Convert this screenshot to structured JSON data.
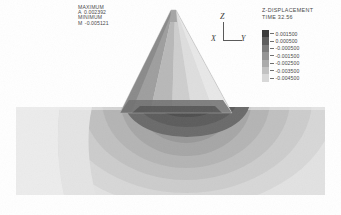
{
  "annotations": {
    "maximum_label": "MAXIMUM",
    "maximum_tag": "A",
    "maximum_value": "0.002392",
    "minimum_label": "MINIMUM",
    "minimum_tag": "M",
    "minimum_value": "-0.005121"
  },
  "triad": {
    "z_label": "Z",
    "y_label": "Y",
    "x_label": "X"
  },
  "legend": {
    "title": "Z-DISPLACEMENT",
    "subtitle": "TIME 32.56",
    "entries": [
      {
        "label": "0.001500",
        "color": "#3c3c3c"
      },
      {
        "label": "0.000500",
        "color": "#5e5e5e"
      },
      {
        "label": "-0.000500",
        "color": "#7b7b7b"
      },
      {
        "label": "-0.001500",
        "color": "#949494"
      },
      {
        "label": "-0.002500",
        "color": "#ababab"
      },
      {
        "label": "-0.003500",
        "color": "#c2c2c2"
      },
      {
        "label": "-0.004500",
        "color": "#d8d8d8"
      }
    ]
  },
  "chart_data": {
    "type": "heatmap",
    "title": "Z-DISPLACEMENT",
    "subtitle": "TIME 32.56",
    "units": "displacement",
    "maximum": 0.002392,
    "minimum": -0.005121,
    "contour_levels": [
      0.0015,
      0.0005,
      -0.0005,
      -0.0015,
      -0.0025,
      -0.0035,
      -0.0045
    ],
    "colormap": "grayscale",
    "legend_position": "top-right",
    "grid": false,
    "axes": [
      "X",
      "Y",
      "Z"
    ],
    "regions": [
      {
        "name": "indenter-cone",
        "shape": "triangle",
        "fill_range": [
          0.0015,
          -0.0015
        ]
      },
      {
        "name": "substrate-block",
        "shape": "rectangle",
        "fill_range": [
          -0.0005,
          -0.0045
        ]
      },
      {
        "name": "contact-zone",
        "shape": "lobe",
        "fill_range": [
          -0.0035,
          -0.005121
        ]
      }
    ]
  }
}
